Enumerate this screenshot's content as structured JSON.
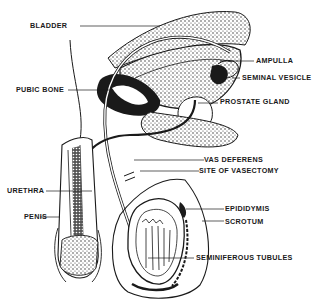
{
  "diagram": {
    "type": "anatomical-illustration",
    "style": {
      "ink": "#1a1a1a",
      "background": "#ffffff"
    },
    "labels": [
      {
        "id": "bladder",
        "text": "BLADDER"
      },
      {
        "id": "ampulla",
        "text": "AMPULLA"
      },
      {
        "id": "seminal_vesicle",
        "text": "SEMINAL VESICLE"
      },
      {
        "id": "pubic_bone",
        "text": "PUBIC BONE"
      },
      {
        "id": "prostate_gland",
        "text": "PROSTATE  GLAND"
      },
      {
        "id": "vas_deferens",
        "text": "VAS DEFERENS"
      },
      {
        "id": "site_of_vasectomy",
        "text": "SITE OF VASECTOMY"
      },
      {
        "id": "urethra",
        "text": "URETHRA"
      },
      {
        "id": "penis",
        "text": "PENIS"
      },
      {
        "id": "epididymis",
        "text": "EPIDIDYMIS"
      },
      {
        "id": "scrotum",
        "text": "SCROTUM"
      },
      {
        "id": "seminiferous_tubules",
        "text": "SEMINIFEROUS TUBULES"
      }
    ]
  }
}
